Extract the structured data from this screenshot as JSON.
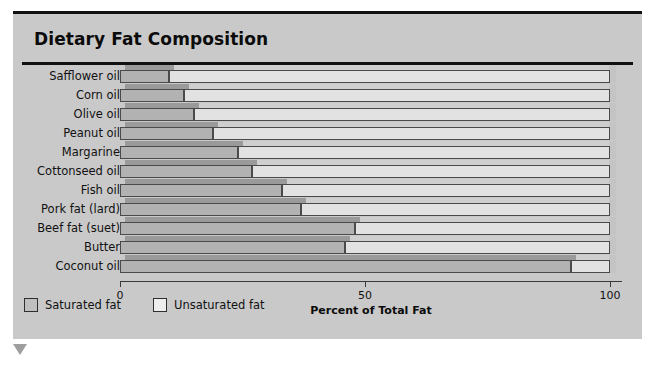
{
  "chart_data": {
    "type": "bar",
    "orientation": "horizontal",
    "stacked": true,
    "title": "Dietary Fat Composition",
    "xlabel": "Percent of Total Fat",
    "ylabel": "",
    "xlim": [
      0,
      100
    ],
    "xticks": [
      "0",
      "50",
      "100"
    ],
    "xtick_values": [
      0,
      50,
      100
    ],
    "grid": false,
    "legend_position": "bottom-left",
    "categories": [
      "Safflower oil",
      "Corn oil",
      "Olive oil",
      "Peanut oil",
      "Margarine",
      "Cottonseed oil",
      "Fish oil",
      "Pork fat (lard)",
      "Beef fat (suet)",
      "Butter",
      "Coconut oil"
    ],
    "series": [
      {
        "name": "Saturated fat",
        "color": "#b2b2b2",
        "values": [
          10,
          13,
          15,
          19,
          24,
          27,
          33,
          37,
          48,
          46,
          92
        ]
      },
      {
        "name": "Unsaturated fat",
        "color": "#e2e2e2",
        "values": [
          90,
          87,
          85,
          81,
          76,
          73,
          67,
          63,
          52,
          54,
          8
        ]
      }
    ]
  },
  "panel": {
    "background_color": "#c9c9c9",
    "accent_rule_color": "#111111"
  },
  "legend": {
    "items": [
      {
        "label": "Saturated fat"
      },
      {
        "label": "Unsaturated fat"
      }
    ]
  }
}
